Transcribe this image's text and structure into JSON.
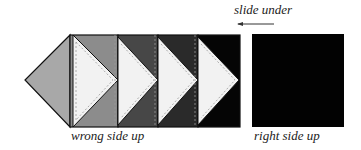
{
  "labels": {
    "slide_under": "slide under",
    "wrong_side_up": "wrong side up",
    "right_side_up": "right side up"
  },
  "colors": {
    "diamond_left": "#a8a8a8",
    "strip_1": "#8c8c8c",
    "strip_2": "#474747",
    "strip_3": "#2a2a2a",
    "strip_4": "#050505",
    "triangle": "#f2f2f2",
    "right_square": "#020202",
    "outline": "#111111"
  }
}
